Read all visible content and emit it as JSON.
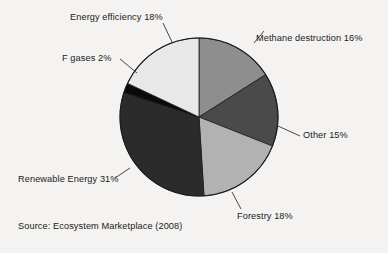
{
  "chart_data": {
    "type": "pie",
    "title": "",
    "subtitle": "",
    "xlabel": "",
    "ylabel": "",
    "legend_position": "none",
    "grid": false,
    "units": "percent",
    "source_note": "Source: Ecosystem Marketplace (2008)",
    "categories": [
      "Methane destruction",
      "Other",
      "Forestry",
      "Renewable Energy",
      "F gases",
      "Energy efficiency"
    ],
    "values": [
      16,
      15,
      18,
      31,
      2,
      18
    ],
    "labels": [
      "Methane destruction 16%",
      "Other 15%",
      "Forestry 18%",
      "Renewable Energy 31%",
      "F gases 2%",
      "Energy efficiency 18%"
    ],
    "colors": [
      "#8e8e8e",
      "#4a4a4a",
      "#b2b2b2",
      "#2b2b2b",
      "#0a0a0a",
      "#e8e8e8"
    ],
    "start_angle_deg": 0,
    "direction": "clockwise",
    "slices": [
      {
        "name": "Methane destruction",
        "value": 16,
        "label": "Methane destruction 16%",
        "color": "#8e8e8e"
      },
      {
        "name": "Other",
        "value": 15,
        "label": "Other 15%",
        "color": "#4a4a4a"
      },
      {
        "name": "Forestry",
        "value": 18,
        "label": "Forestry 18%",
        "color": "#b2b2b2"
      },
      {
        "name": "Renewable Energy",
        "value": 31,
        "label": "Renewable Energy 31%",
        "color": "#2b2b2b"
      },
      {
        "name": "F gases",
        "value": 2,
        "label": "F gases 2%",
        "color": "#0a0a0a"
      },
      {
        "name": "Energy efficiency",
        "value": 18,
        "label": "Energy efficiency 18%",
        "color": "#e8e8e8"
      }
    ]
  },
  "figure": {
    "background_color": "#f4f3f1",
    "outline_color": "#1a1a1a",
    "center_x": 199,
    "center_y": 117,
    "radius": 79
  },
  "callouts": {
    "energy_efficiency": "Energy efficiency 18%",
    "methane_destruction": "Methane destruction 16%",
    "f_gases": "F gases 2%",
    "other": "Other 15%",
    "renewable_energy": "Renewable Energy 31%",
    "forestry": "Forestry 18%"
  },
  "source": {
    "text": "Source: Ecosystem Marketplace (2008)"
  }
}
